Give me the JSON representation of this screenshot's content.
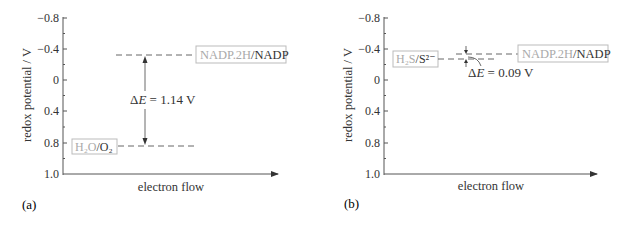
{
  "panels": [
    {
      "id": "a",
      "panel_label": "(a)",
      "y_axis_title": "redox potential / V",
      "x_axis_title": "electron flow",
      "y_ticks": [
        "−0.8",
        "−0.4",
        "0",
        "0.4",
        "0.8",
        "1.0"
      ],
      "couples": [
        {
          "reduced": "NADP.2H",
          "separator": "/",
          "oxidized": "NADP",
          "potential_V": -0.32
        },
        {
          "reduced": "H₂O",
          "separator": "/",
          "oxidized": "O₂",
          "potential_V": 0.82
        }
      ],
      "delta_E_label": "ΔE = 1.14 V",
      "delta_E_prefix": "Δ",
      "delta_E_var": "E",
      "delta_E_value": " = 1.14 V"
    },
    {
      "id": "b",
      "panel_label": "(b)",
      "y_axis_title": "redox potential / V",
      "x_axis_title": "electron flow",
      "y_ticks": [
        "−0.8",
        "−0.4",
        "0",
        "0.4",
        "0.8",
        "1.0"
      ],
      "couples": [
        {
          "reduced": "H₂S",
          "separator": "/",
          "oxidized": "S²⁻",
          "potential_V": -0.23
        },
        {
          "reduced": "NADP.2H",
          "separator": "/",
          "oxidized": "NADP",
          "potential_V": -0.32
        }
      ],
      "delta_E_label": "ΔE = 0.09 V",
      "delta_E_prefix": "Δ",
      "delta_E_var": "E",
      "delta_E_value": " = 0.09 V"
    }
  ]
}
